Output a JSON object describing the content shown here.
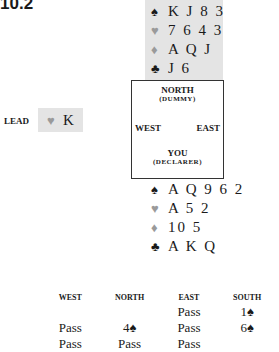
{
  "title": "10.2",
  "dummy": {
    "spades": "K J 8 3",
    "hearts": "7 6 4 3",
    "diamonds": "A Q J",
    "clubs": "J 6"
  },
  "declarer": {
    "spades": "A Q 9 6 2",
    "hearts": "A 5 2",
    "diamonds": "10 5",
    "clubs": "A K Q"
  },
  "suits": {
    "spade": "♠",
    "heart": "♥",
    "diamond": "♦",
    "club": "♣"
  },
  "compass": {
    "north": "NORTH",
    "north_sub": "(DUMMY)",
    "west": "WEST",
    "east": "EAST",
    "south": "YOU",
    "south_sub": "(DECLARER)"
  },
  "lead": {
    "label": "LEAD",
    "suit": "♥",
    "rank": "K"
  },
  "auction": {
    "headers": [
      "WEST",
      "NORTH",
      "EAST",
      "SOUTH"
    ],
    "rows": [
      [
        "",
        "",
        "Pass",
        "1♠"
      ],
      [
        "Pass",
        "4♠",
        "Pass",
        "6♠"
      ],
      [
        "Pass",
        "Pass",
        "Pass",
        ""
      ]
    ]
  },
  "colors": {
    "panel_gray": "#e4e4e4",
    "red_suit_gray": "#9a9a9a",
    "text": "#1a1a1a"
  }
}
